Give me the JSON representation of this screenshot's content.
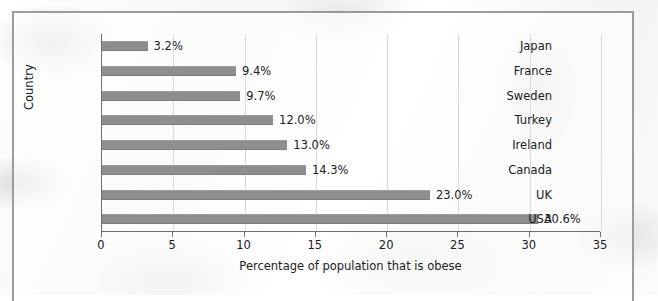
{
  "chart_data": {
    "type": "bar",
    "orientation": "horizontal",
    "title": "",
    "xlabel": "Percentage of population that is obese",
    "ylabel": "Country",
    "xlim": [
      0,
      35
    ],
    "xticks": [
      "0",
      "5",
      "10",
      "15",
      "20",
      "25",
      "30",
      "35"
    ],
    "grid": true,
    "legend": null,
    "bar_color": "#8e8e8e",
    "categories": [
      "Japan",
      "France",
      "Sweden",
      "Turkey",
      "Ireland",
      "Canada",
      "UK",
      "USA"
    ],
    "values": [
      3.2,
      9.4,
      9.7,
      12.0,
      13.0,
      14.3,
      23.0,
      30.6
    ],
    "data_labels": [
      "3.2%",
      "9.4%",
      "9.7%",
      "12.0%",
      "13.0%",
      "14.3%",
      "23.0%",
      "30.6%"
    ]
  }
}
